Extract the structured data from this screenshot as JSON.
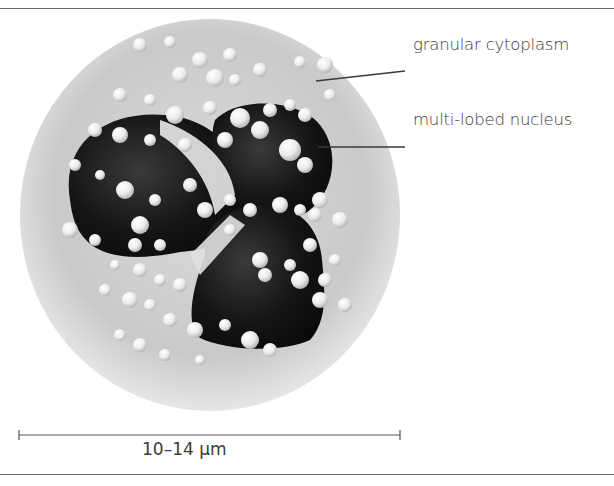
{
  "labels": {
    "cytoplasm": "granular cytoplasm",
    "nucleus": "multi-lobed nucleus"
  },
  "scale_bar": {
    "label": "10–14 μm"
  },
  "colors": {
    "cytoplasm": "#d6d6d6",
    "nucleus": "#151515",
    "granule": "#f2f2f2",
    "line": "#3a3a3a"
  }
}
